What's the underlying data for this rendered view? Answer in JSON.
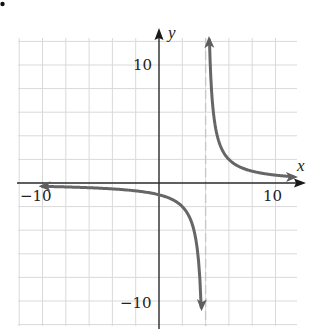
{
  "chart_data": {
    "type": "line",
    "title": "",
    "function": "y = 4/(x - 4)",
    "xlabel": "x",
    "ylabel": "y",
    "xlim": [
      -12,
      12
    ],
    "ylim": [
      -12,
      12
    ],
    "grid": true,
    "grid_step": 2,
    "tick_labels": {
      "x": [
        {
          "value": -10,
          "label": "−10"
        },
        {
          "value": 10,
          "label": "10"
        }
      ],
      "y": [
        {
          "value": 10,
          "label": "10"
        },
        {
          "value": -10,
          "label": "−10"
        }
      ]
    },
    "vertical_asymptote": 4,
    "horizontal_asymptote": 0,
    "series": [
      {
        "name": "left branch",
        "x": [
          -10,
          -8,
          -6,
          -4,
          -2,
          0,
          1,
          2,
          3,
          3.5,
          3.6
        ],
        "y": [
          -0.29,
          -0.33,
          -0.4,
          -0.5,
          -0.67,
          -1,
          -1.33,
          -2,
          -4,
          -8,
          -10
        ]
      },
      {
        "name": "right branch",
        "x": [
          4.35,
          4.5,
          5,
          6,
          7,
          8,
          9,
          10,
          11.5
        ],
        "y": [
          11.4,
          8,
          4,
          2,
          1.33,
          1,
          0.8,
          0.67,
          0.53
        ]
      }
    ],
    "colors": {
      "curve": "#666666",
      "axis": "#2a2a2a",
      "grid": "#d9d9d9",
      "asymptote": "#c8c8c8"
    }
  },
  "labels": {
    "x_axis": "x",
    "y_axis": "y",
    "x_neg10": "−10",
    "x_pos10": "10",
    "y_pos10": "10",
    "y_neg10": "−10"
  }
}
